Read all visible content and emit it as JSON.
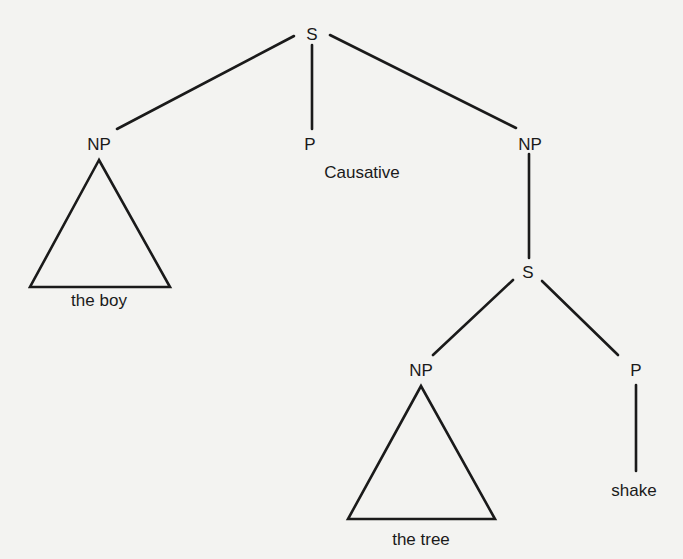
{
  "diagram": {
    "type": "syntax-tree",
    "colors": {
      "background": "#f3f3f1",
      "ink": "#1a1a1a"
    },
    "nodes": {
      "root_s": {
        "label": "S",
        "x": 312,
        "y": 34
      },
      "np_left": {
        "label": "NP",
        "x": 99,
        "y": 144
      },
      "p_causative": {
        "label": "P",
        "x": 310,
        "y": 144
      },
      "causative": {
        "label": "Causative",
        "x": 362,
        "y": 172
      },
      "np_right": {
        "label": "NP",
        "x": 530,
        "y": 144
      },
      "embedded_s": {
        "label": "S",
        "x": 528,
        "y": 272
      },
      "np_embedded": {
        "label": "NP",
        "x": 421,
        "y": 370
      },
      "p_embedded": {
        "label": "P",
        "x": 636,
        "y": 370
      },
      "the_boy": {
        "label": "the boy",
        "x": 99,
        "y": 300
      },
      "the_tree": {
        "label": "the tree",
        "x": 421,
        "y": 539
      },
      "shake": {
        "label": "shake",
        "x": 634,
        "y": 490
      }
    }
  }
}
